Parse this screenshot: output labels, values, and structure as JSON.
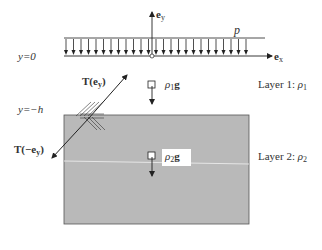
{
  "diagram": {
    "type": "two-layer fluid/solid stratification with surface pressure",
    "axes": {
      "ey_label": "e",
      "ey_sub": "y",
      "ex_label": "e",
      "ex_sub": "x"
    },
    "surface": {
      "label": "y=0",
      "pressure_label": "p",
      "arrow_count": 25
    },
    "interface": {
      "label": "y=−h"
    },
    "traction": {
      "upper": {
        "prefix": "T(e",
        "sub": "y",
        "suffix": ")"
      },
      "lower": {
        "prefix": "T(−e",
        "sub": "y",
        "suffix": ")"
      }
    },
    "layers": [
      {
        "name": "Layer 1: ",
        "density": "ρ",
        "density_sub": "1",
        "body_force": "ρ",
        "body_force_sub": "1",
        "body_force_vec": "g",
        "fill": "#ffffff"
      },
      {
        "name": "Layer 2: ",
        "density": "ρ",
        "density_sub": "2",
        "body_force": "ρ",
        "body_force_sub": "2",
        "body_force_vec": "g",
        "fill": "#b8b8b8"
      }
    ],
    "colors": {
      "line": "#222222",
      "layer2_fill": "#b9b9b9",
      "text": "#333333"
    }
  }
}
